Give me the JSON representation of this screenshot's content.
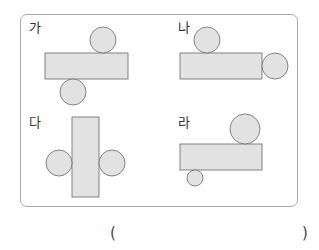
{
  "problem": {
    "options": [
      {
        "label": "가",
        "label_pos": [
          29,
          21
        ]
      },
      {
        "label": "나",
        "label_pos": [
          178,
          21
        ]
      },
      {
        "label": "다",
        "label_pos": [
          29,
          116
        ]
      },
      {
        "label": "라",
        "label_pos": [
          178,
          116
        ]
      }
    ],
    "answer_paren_open": "(",
    "answer_paren_close": ")",
    "colors": {
      "shape_fill": "#e2e2e2",
      "shape_stroke": "#777777",
      "frame_border": "#a8a8a8"
    }
  }
}
